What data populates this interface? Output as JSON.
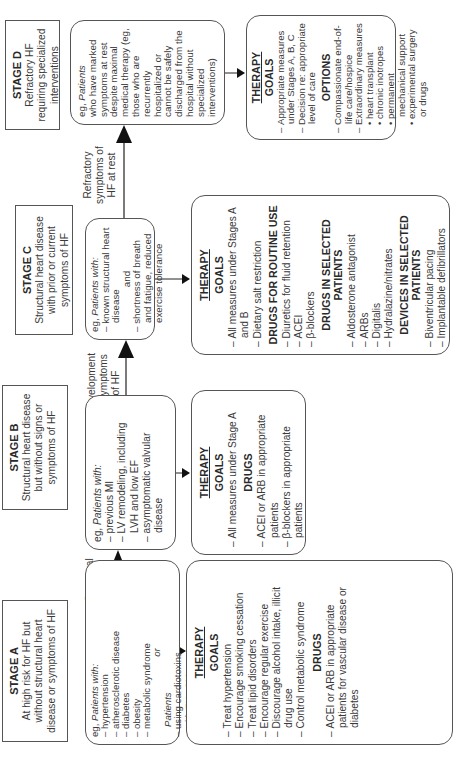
{
  "stages": [
    {
      "id": "A",
      "title": "STAGE A",
      "description": "At high risk for HF but without structural heart disease or symptoms of HF",
      "patients": {
        "intro_eg": "eg,",
        "intro_label": "Patients with:",
        "items": [
          "hypertension",
          "atherosclerotic disease",
          "diabetes",
          "obesity",
          "metabolic syndrome"
        ],
        "connector": "or",
        "second_label": "Patients",
        "second_items": [
          "using cardiotoxins",
          "with FHx CM"
        ]
      },
      "therapy": {
        "title": "THERAPY",
        "goals_label": "GOALS",
        "goals": [
          "Treat hypertension",
          "Encourage smoking cessation",
          "Treat lipid disorders",
          "Encourage regular exercise",
          "Discourage alcohol intake, illicit drug use",
          "Control metabolic syndrome"
        ],
        "drugs_label": "DRUGS",
        "drugs": [
          "ACEI or ARB in appropriate patients for vascular disease or diabetes"
        ]
      }
    },
    {
      "id": "B",
      "title": "STAGE B",
      "description": "Structural heart disease but without signs or symptoms of HF",
      "patients": {
        "intro_eg": "eg,",
        "intro_label": "Patients with:",
        "items": [
          "previous MI",
          "LV remodeling, including LVH and low EF",
          "asymptomatic valvular disease"
        ]
      },
      "therapy": {
        "title": "THERAPY",
        "goals_label": "GOALS",
        "goals": [
          "All measures under Stage A"
        ],
        "drugs_label": "DRUGS",
        "drugs": [
          "ACEI or ARB in appropriate patients",
          "β-blockers in appropriate patients"
        ]
      }
    },
    {
      "id": "C",
      "title": "STAGE C",
      "description": "Structural heart disease with prior or current symptoms of HF",
      "patients": {
        "intro_eg": "eg,",
        "intro_label": "Patients with:",
        "items": [
          "known structural heart disease"
        ],
        "connector": "and",
        "items2": [
          "shortness of breath and fatigue, reduced exercise tolerance"
        ]
      },
      "therapy": {
        "title": "THERAPY",
        "goals_label": "GOALS",
        "goals": [
          "All measures under Stages A and B",
          "Dietary salt restriction"
        ],
        "routine_label": "DRUGS FOR ROUTINE USE",
        "routine": [
          "Diuretics for fluid retention",
          "ACEI",
          "β-blockers"
        ],
        "selected_drugs_label": "DRUGS IN SELECTED PATIENTS",
        "selected_drugs": [
          "Aldosterone antagonist",
          "ARBs",
          "Digitalis",
          "Hydralazine/nitrates"
        ],
        "devices_label": "DEVICES IN SELECTED PATIENTS",
        "devices": [
          "Biventricular pacing",
          "Implantable defibrillators"
        ]
      }
    },
    {
      "id": "D",
      "title": "STAGE D",
      "description": "Refractory HF requiring specialized interventions",
      "patients": {
        "intro_eg": "eg,",
        "intro_label": "Patients",
        "text": "who have marked symptoms at rest despite maximal medical therapy (eg, those who are recurrently hospitalized or cannot be safely discharged from the hospital without specialized interventions)"
      },
      "therapy": {
        "title": "THERAPY",
        "goals_label": "GOALS",
        "goals": [
          "Appropriate measures under Stages A, B, C",
          "Decision re: appropriate level of care"
        ],
        "options_label": "OPTIONS",
        "options": [
          "Compassionate end-of-life care/hospice",
          "Extraordinary measures"
        ],
        "extraordinary": [
          "heart transplant",
          "chronic inotropes",
          "permanent mechanical support",
          "experimental surgery or drugs"
        ]
      }
    }
  ],
  "transitions": [
    {
      "from": "A",
      "to": "B",
      "label": "Structural heart disease"
    },
    {
      "from": "B",
      "to": "C",
      "label": "Development of symptoms of HF"
    },
    {
      "from": "C",
      "to": "D",
      "label": "Refractory symptoms of HF at rest"
    }
  ]
}
